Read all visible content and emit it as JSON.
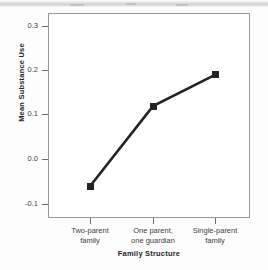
{
  "chart_data": {
    "type": "line",
    "title": "",
    "subtitle": "",
    "xlabel": "Family Structure",
    "ylabel": "Mean Substance Use",
    "categories": [
      "Two-parent\nfamily",
      "One parent,\none guardian",
      "Single-parent\nfamily"
    ],
    "category_lines": [
      [
        "Two-parent",
        "family"
      ],
      [
        "One parent,",
        "one guardian"
      ],
      [
        "Single-parent",
        "family"
      ]
    ],
    "values": [
      -0.06,
      0.12,
      0.19
    ],
    "ylim": [
      -0.1,
      0.3
    ],
    "yticks": [
      0.3,
      0.2,
      0.1,
      0.0,
      -0.1
    ],
    "ytick_labels": [
      "0.3",
      "0.2",
      "0.1",
      "0.0",
      "-0.1"
    ],
    "grid": false,
    "legend": null,
    "marker": "square",
    "line_color": "#232323",
    "marker_color": "#232323",
    "frame_color": "#9a9a9a",
    "background": "#ffffff"
  },
  "figure": {
    "page_background": "#fdfdfd",
    "axis_text_color": "#3d3d3d",
    "title_text_color": "#262626"
  }
}
